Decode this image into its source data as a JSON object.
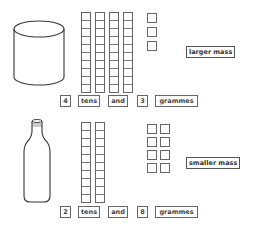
{
  "top": {
    "container": "cylinder-jar",
    "tens_rods": 4,
    "units": 3,
    "mass_label": "larger mass",
    "statement": {
      "tens_value": "4",
      "tens_word": "tens",
      "and_word": "and",
      "units_value": "3",
      "unit_word": "grammes"
    }
  },
  "bottom": {
    "container": "bottle",
    "tens_rods": 2,
    "units": 8,
    "mass_label": "smaller mass",
    "statement": {
      "tens_value": "2",
      "tens_word": "tens",
      "and_word": "and",
      "units_value": "8",
      "unit_word": "grammes"
    }
  },
  "colors": {
    "stroke": "#555555",
    "background": "#ffffff"
  }
}
